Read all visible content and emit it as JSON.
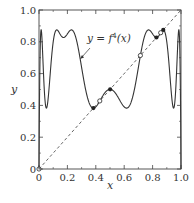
{
  "chart_data": {
    "type": "line",
    "title": "",
    "xlabel": "x",
    "ylabel": "y",
    "xlim": [
      0,
      1
    ],
    "ylim": [
      0,
      1
    ],
    "xticks": [
      0,
      0.2,
      0.4,
      0.6,
      0.8,
      1.0
    ],
    "xtick_labels": [
      "0",
      "0.2",
      "0.4",
      "0.6",
      "0.8",
      "1.0"
    ],
    "yticks": [
      0,
      0.2,
      0.4,
      0.6,
      0.8,
      1.0
    ],
    "ytick_labels": [
      "0",
      "0.2",
      "0.4",
      "0.6",
      "0.8",
      "1.0"
    ],
    "grid": false,
    "series": [
      {
        "name": "y = f^4(x)",
        "style": "solid",
        "color": "#333333",
        "function": "fourth iterate of logistic map r x (1-x)",
        "r": 3.5
      },
      {
        "name": "y = x",
        "style": "dashed",
        "color": "#555555",
        "x": [
          0,
          1
        ],
        "y": [
          0,
          1
        ]
      }
    ],
    "stable_points": {
      "marker": "filled-circle",
      "x": [
        0.383,
        0.501,
        0.827,
        0.875
      ]
    },
    "unstable_points": {
      "marker": "open-circle",
      "x": [
        0,
        0.428,
        0.714,
        0.857
      ]
    },
    "annotations": [
      {
        "text": "y = f",
        "superscript": "4",
        "suffix": "(x)",
        "arrow_to": [
          0.29,
          0.7
        ]
      }
    ]
  }
}
